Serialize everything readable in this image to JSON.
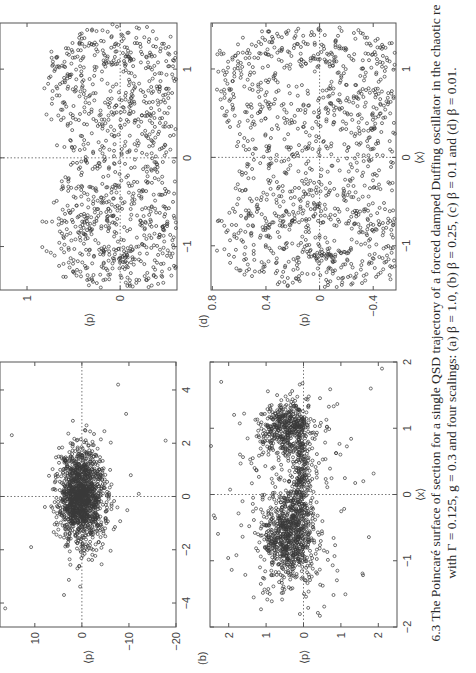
{
  "figure": {
    "caption_line1": "6.3 The Poincaré surface of section for a single QSD trajectory of a forced damped Duffing oscillator in the chaotic re",
    "caption_line2": "with Γ = 0.125, g = 0.3 and four scalings: (a) β = 1.0, (b) β = 0.25, (c) β = 0.1 and (d) β = 0.01."
  },
  "chart_data": [
    {
      "id": "a",
      "panel_label": "(a)",
      "type": "scatter",
      "title": "β = 1.0",
      "xlabel": "⟨x⟩",
      "ylabel": "⟨p⟩",
      "xlim": [
        -4.9,
        5.05
      ],
      "ylim": [
        -20,
        17.4
      ],
      "xticks": [
        -4,
        -2,
        0,
        2,
        4
      ],
      "yticks": [
        -20,
        -10,
        0,
        10
      ],
      "grid": false,
      "zero_lines": true,
      "description": "Broad diffuse cloud centred near (0, 0), x spread about ±2, p spread about ±5, with sparse outliers reaching x ≈ ±4 and p ≈ ±15",
      "clusters": [
        {
          "cx": 0.0,
          "cy": 0.0,
          "sx": 0.9,
          "sy": 2.4,
          "n": 1400
        }
      ],
      "outliers": [
        [
          -4.2,
          16.3
        ],
        [
          2.3,
          14.9
        ],
        [
          2.1,
          -17.8
        ],
        [
          0.8,
          -10.4
        ],
        [
          -1.9,
          10.8
        ],
        [
          0.1,
          -12.1
        ],
        [
          -3.7,
          3.8
        ],
        [
          4.2,
          -7.7
        ],
        [
          3.1,
          -9.4
        ]
      ]
    },
    {
      "id": "b",
      "panel_label": "(b)",
      "type": "scatter",
      "title": "β = 0.25",
      "xlabel": "⟨x⟩",
      "ylabel": "⟨p⟩",
      "xlim": [
        -2,
        2
      ],
      "ylim": [
        -2.5,
        2.5
      ],
      "xticks": [
        -2,
        -1,
        0,
        1,
        2
      ],
      "yticks": [
        -2,
        -1,
        0,
        1,
        2
      ],
      "ytick_labels": [
        "2",
        "1",
        "0",
        "1",
        "2"
      ],
      "grid": false,
      "zero_lines": true,
      "description": "Two dense lobes near (-0.7, 0.4) and (1.0, 0.2) joined by a band, with a scattered halo",
      "clusters": [
        {
          "cx": -0.65,
          "cy": 0.4,
          "sx": 0.32,
          "sy": 0.35,
          "n": 700
        },
        {
          "cx": 1.0,
          "cy": 0.45,
          "sx": 0.2,
          "sy": 0.35,
          "n": 450
        },
        {
          "cx": 0.2,
          "cy": 0.05,
          "sx": 0.35,
          "sy": 0.12,
          "n": 200
        },
        {
          "cx": 0.0,
          "cy": 0.3,
          "sx": 0.9,
          "sy": 0.8,
          "n": 250
        }
      ],
      "outliers": [
        [
          1.9,
          -2.1
        ],
        [
          1.7,
          2.2
        ],
        [
          -1.5,
          0.9
        ],
        [
          0.2,
          -1.6
        ],
        [
          1.6,
          -1.8
        ]
      ]
    },
    {
      "id": "c",
      "panel_label": "(c)",
      "type": "scatter",
      "title": "β = 0.1",
      "xlabel": "⟨x⟩",
      "ylabel": "⟨p⟩",
      "xlim": [
        -1.49,
        1.52
      ],
      "ylim": [
        -0.61,
        1.29
      ],
      "xticks": [
        -1,
        0,
        1
      ],
      "yticks": [
        0,
        1
      ],
      "grid": false,
      "zero_lines": true,
      "description": "Noisy S-shaped strange attractor: left lobe spiral around (-0.8, 0.3), right lobe near (1.0, 0.7), thickened by noise"
    },
    {
      "id": "d",
      "panel_label": "(d)",
      "type": "scatter",
      "title": "β = 0.01",
      "xlabel": "⟨x⟩",
      "ylabel": "⟨p⟩",
      "xlim": [
        -1.5,
        1.52
      ],
      "ylim": [
        -0.57,
        0.81
      ],
      "xticks": [
        -1,
        0,
        1
      ],
      "yticks": [
        -0.4,
        0,
        0.4,
        0.8
      ],
      "grid": false,
      "zero_lines": true,
      "description": "Sharp classical Duffing strange attractor: two nested S-shaped folded bands spanning x from -1.4 to 1.4 and p from -0.45 to 0.78"
    }
  ]
}
